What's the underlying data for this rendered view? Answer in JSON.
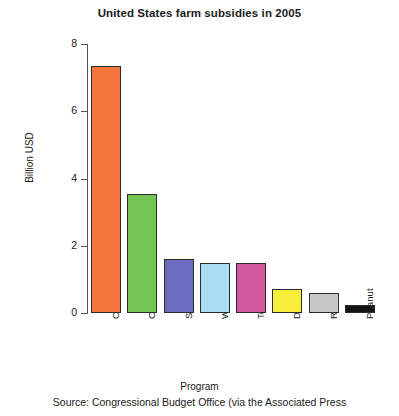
{
  "chart_data": {
    "type": "bar",
    "title": "United States farm subsidies in 2005",
    "xlabel": "Program",
    "ylabel": "Billion USD",
    "categories": [
      "Corn/feed",
      "Cotton",
      "Soybean",
      "Wheat",
      "Tobacco",
      "Dairy",
      "Rice",
      "Peanut"
    ],
    "values": [
      7.35,
      3.55,
      1.6,
      1.5,
      1.5,
      0.7,
      0.6,
      0.25
    ],
    "colors": [
      "#F4763C",
      "#72C550",
      "#6B6BC0",
      "#A8DCF2",
      "#D4589E",
      "#F7EE3C",
      "#C8C8C8",
      "#141414"
    ],
    "ylim": [
      0,
      8
    ],
    "yticks": [
      0,
      2,
      4,
      6,
      8
    ],
    "ytick_labels": [
      "0",
      "2",
      "4",
      "6",
      "8"
    ],
    "grid": false,
    "legend": "none",
    "bar_edge_color": "#2b2b2b",
    "source_note": "Source:  Congressional Budget Office (via the Associated Press"
  }
}
